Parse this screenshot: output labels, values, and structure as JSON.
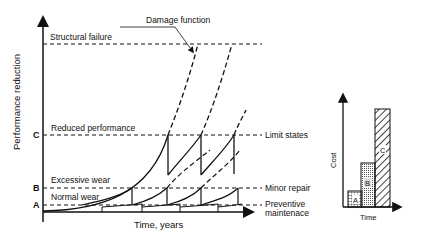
{
  "main_chart": {
    "y_axis_label": "Performance reduction",
    "x_axis_label": "Time, years",
    "title_annotation": "Damage function",
    "levels": [
      {
        "marker": "",
        "label": "Structural failure"
      },
      {
        "marker": "C",
        "label": "Reduced performance"
      },
      {
        "marker": "B",
        "label": "Excessive wear"
      },
      {
        "marker": "A",
        "label": "Normal wear"
      }
    ],
    "right_labels": {
      "limit_states": "Limit states",
      "minor_repair": "Minor repair",
      "preventive_1": "Preventive",
      "preventive_2": "maintenace"
    }
  },
  "cost_chart": {
    "y_axis_label": "Cost",
    "x_axis_label": "Time",
    "bars": [
      {
        "label": "A",
        "pattern": "horizontal-grid",
        "relative_height": 0.15
      },
      {
        "label": "B",
        "pattern": "dots",
        "relative_height": 0.55
      },
      {
        "label": "C",
        "pattern": "diagonal-hatch",
        "relative_height": 1.0
      }
    ]
  },
  "colors": {
    "ink": "#111111",
    "background": "#ffffff"
  }
}
